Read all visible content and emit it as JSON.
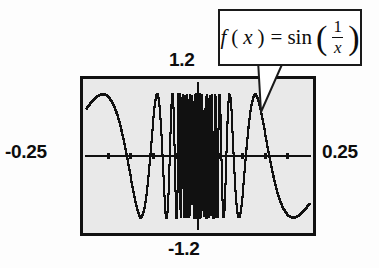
{
  "figure": {
    "name": "graph-of-sin-one-over-x",
    "background_color": "#fdfdfd",
    "plot_background_color": "#e9e9e9",
    "curve_color": "#111111",
    "frame_color": "#111111"
  },
  "callout": {
    "name": "formula-callout",
    "formula_plain": "f(x) = sin(1/x)",
    "f": "f",
    "lparen_var": "(",
    "x_var": "x",
    "rparen_var": ")",
    "equals": "=",
    "sin": "sin",
    "big_lparen": "(",
    "numerator": "1",
    "denominator": "x",
    "big_rparen": ")",
    "border_color": "#1a1a1a",
    "fill_color": "#ffffff"
  },
  "axis_labels": {
    "y_max": "1.2",
    "y_min": "-1.2",
    "x_min": "-0.25",
    "x_max": "0.25"
  },
  "chart_data": {
    "type": "line",
    "title": "",
    "subtitle": "",
    "function": "f(x) = sin(1/x)",
    "xlabel": "",
    "ylabel": "",
    "xlim": [
      -0.25,
      0.25
    ],
    "ylim": [
      -1.2,
      1.2
    ],
    "grid": false,
    "legend": null,
    "legend_position": "none",
    "axis_style": "centered-cross",
    "x_tick_values": [
      -0.2,
      -0.15,
      -0.1,
      -0.05,
      0.05,
      0.1,
      0.15,
      0.2
    ],
    "y_tick_values": [
      -1.0,
      -0.8,
      -0.6,
      -0.4,
      -0.2,
      0.2,
      0.4,
      0.6,
      0.8,
      1.0
    ],
    "annotations": [
      {
        "text": "f(x) = sin(1/x)",
        "target_x": 0.082,
        "target_y": 0.62
      }
    ],
    "series": [
      {
        "name": "sin(1/x)",
        "color": "#111111",
        "samples": 1400,
        "x_start": -0.25,
        "x_end": 0.25,
        "note": "y = sin(1/x); undefined at x = 0, sampled densely, rendered as stair-stepped polyline"
      }
    ]
  }
}
